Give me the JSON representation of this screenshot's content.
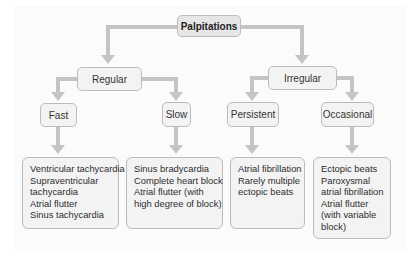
{
  "diagram": {
    "root": {
      "label": "Palpitations"
    },
    "level1": [
      {
        "label": "Regular"
      },
      {
        "label": "Irregular"
      }
    ],
    "level2": [
      {
        "label": "Fast"
      },
      {
        "label": "Slow"
      },
      {
        "label": "Persistent"
      },
      {
        "label": "Occasional"
      }
    ],
    "leaves": [
      {
        "lines": [
          "Ventricular tachycardia",
          "Supraventricular",
          "tachycardia",
          "Atrial flutter",
          "Sinus tachycardia"
        ]
      },
      {
        "lines": [
          "Sinus bradycardia",
          "Complete heart block",
          "Atrial flutter (with",
          "high degree of block)"
        ]
      },
      {
        "lines": [
          "Atrial fibrillation",
          "Rarely multiple",
          "ectopic beats"
        ]
      },
      {
        "lines": [
          "Ectopic beats",
          "Paroxysmal",
          "atrial fibrillation",
          "Atrial flutter",
          "(with variable",
          "block)"
        ]
      }
    ],
    "colors": {
      "connector": "#c4c4c4",
      "node_fill": "#f3f3f3",
      "root_fill": "#e6e6e6",
      "border": "#bcbcbc"
    }
  }
}
